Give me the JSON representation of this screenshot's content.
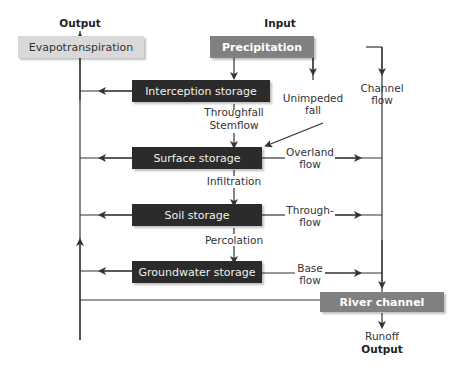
{
  "headers": {
    "output_top": "Output",
    "input_top": "Input",
    "output_bottom": "Output"
  },
  "boxes": {
    "evapotranspiration": "Evapotranspiration",
    "precipitation": "Precipitation",
    "interception_storage": "Interception storage",
    "surface_storage": "Surface storage",
    "soil_storage": "Soil storage",
    "groundwater_storage": "Groundwater storage",
    "river_channel": "River channel"
  },
  "flows": {
    "throughfall": "Throughfall",
    "stemflow": "Stemflow",
    "unimpeded_1": "Unimpeded",
    "unimpeded_2": "fall",
    "channel_1": "Channel",
    "channel_2": "flow",
    "infiltration": "Infiltration",
    "percolation": "Percolation",
    "overland_1": "Overland",
    "overland_2": "flow",
    "through_1": "Through-",
    "through_2": "flow",
    "base_1": "Base",
    "base_2": "flow",
    "runoff": "Runoff"
  },
  "colors": {
    "dark_box": "#2b2b2b",
    "grey_box": "#808080",
    "light_box": "#d9d9d9",
    "line": "#333333"
  }
}
